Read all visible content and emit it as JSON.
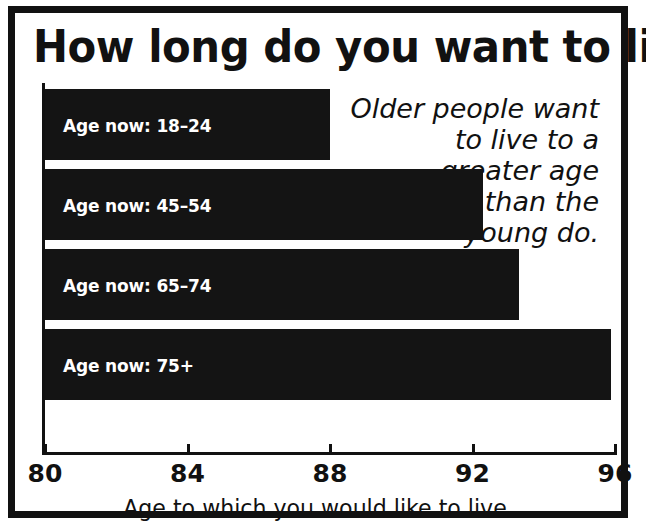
{
  "chart_data": {
    "type": "bar",
    "orientation": "horizontal",
    "title": "How long do you want to live?",
    "xlabel": "Age to which you would like to live",
    "ylabel": "",
    "xlim": [
      80,
      96
    ],
    "xticks": [
      80,
      84,
      88,
      92,
      96
    ],
    "xtick_labels": [
      "80",
      "84",
      "88",
      "92",
      "96"
    ],
    "grid": false,
    "legend": null,
    "categories": [
      "Age now: 18–24",
      "Age now: 45–54",
      "Age now: 65–74",
      "Age now: 75+"
    ],
    "values": [
      88.0,
      92.3,
      93.3,
      95.9
    ],
    "bar_color": "#141414",
    "label_color": "#ffffff",
    "annotation": "Older people want to live to a greater age than the young do.",
    "annotation_lines": [
      "Older people want",
      "to live to a",
      "greater age",
      "than the",
      "young do."
    ]
  },
  "frame": {
    "border_color": "#111111",
    "background": "#ffffff"
  }
}
